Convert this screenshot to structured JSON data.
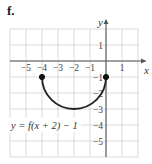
{
  "panel_label": "f.",
  "chart_data": {
    "type": "line",
    "title": "",
    "equation_label": "y = f(x + 2) − 1",
    "xlabel": "x",
    "ylabel": "y",
    "xlim": [
      -6,
      2
    ],
    "ylim": [
      -6,
      2
    ],
    "grid": true,
    "x_ticks": [
      -5,
      -4,
      -3,
      -2,
      -1,
      1
    ],
    "x_tick_labels": [
      "−5",
      "−4",
      "−3",
      "−2",
      "−1",
      "1"
    ],
    "y_ticks": [
      1,
      -1,
      -2,
      -3,
      -4,
      -5
    ],
    "y_tick_labels": [
      "1",
      "−1",
      "−2",
      "−3",
      "−4",
      "−5"
    ],
    "series": [
      {
        "name": "y = f(x + 2) − 1",
        "shape": "lower semicircle",
        "center": [
          -2,
          -1
        ],
        "radius": 2,
        "points": [
          [
            -4,
            -1
          ],
          [
            -3.73,
            -2
          ],
          [
            -3,
            -2.73
          ],
          [
            -2,
            -3
          ],
          [
            -1,
            -2.73
          ],
          [
            -0.27,
            -2
          ],
          [
            0,
            -1
          ]
        ],
        "endpoints": [
          {
            "x": -4,
            "y": -1,
            "filled": true
          },
          {
            "x": 0,
            "y": -1,
            "filled": true
          }
        ]
      }
    ]
  }
}
